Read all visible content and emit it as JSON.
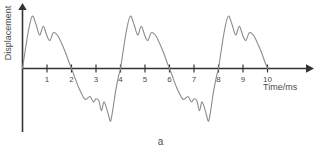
{
  "figure": {
    "caption": "a",
    "line_color": "#8c8c8c",
    "axis_color": "#333333",
    "background": "#ffffff"
  },
  "chart_data": {
    "type": "line",
    "title": "",
    "subtitle": "",
    "caption": "a",
    "xlabel": "Time/ms",
    "ylabel": "Displacement",
    "xlim": [
      0,
      10.6
    ],
    "ylim": [
      -1.1,
      1.1
    ],
    "grid": false,
    "legend": false,
    "legend_position": "none",
    "x_ticks": [
      1,
      2,
      3,
      4,
      5,
      6,
      7,
      8,
      9,
      10
    ],
    "x_tick_labels": [
      "1",
      "2",
      "3",
      "4",
      "5",
      "6",
      "7",
      "8",
      "9",
      "10"
    ],
    "y_ticks": [],
    "y_tick_labels": [],
    "period_ms": 4,
    "series": [
      {
        "name": "Displacement",
        "color": "#8c8c8c",
        "x": [
          0.0,
          0.1,
          0.25,
          0.4,
          0.55,
          0.7,
          0.85,
          1.0,
          1.12,
          1.25,
          1.38,
          1.5,
          1.62,
          1.75,
          1.88,
          2.0,
          2.1,
          2.3,
          2.55,
          2.75,
          2.9,
          3.0,
          3.12,
          3.22,
          3.32,
          3.42,
          3.52,
          3.6,
          3.7,
          3.8,
          3.92,
          4.0
        ],
        "y": [
          0.0,
          0.3,
          0.72,
          0.97,
          0.82,
          0.62,
          0.78,
          0.6,
          0.52,
          0.66,
          0.64,
          0.56,
          0.44,
          0.3,
          0.14,
          0.0,
          -0.12,
          -0.36,
          -0.57,
          -0.52,
          -0.62,
          -0.56,
          -0.6,
          -0.78,
          -0.62,
          -0.72,
          -0.88,
          -0.97,
          -0.72,
          -0.42,
          -0.14,
          0.0
        ]
      }
    ],
    "axes": {
      "x_axis_arrow": true,
      "y_axis_arrow": true,
      "origin_label": ""
    }
  },
  "labels": {
    "y_axis": "Displacement",
    "x_axis": "Time/ms",
    "ticks": [
      "1",
      "2",
      "3",
      "4",
      "5",
      "6",
      "7",
      "8",
      "9",
      "10"
    ]
  }
}
